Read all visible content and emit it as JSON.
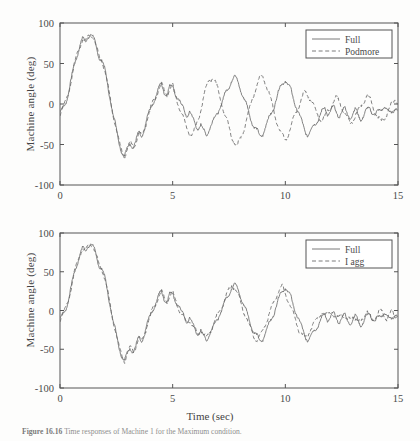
{
  "figure": {
    "caption_number": "Figure 16.16",
    "caption_text": "Time responses of Machine 1 for the Maximum condition."
  },
  "axis": {
    "xlabel": "Time (sec)",
    "ylabel": "Machine angle (deg)",
    "xticks": [
      "0",
      "5",
      "10",
      "15"
    ],
    "yticks": [
      "100",
      "50",
      "0",
      "-50",
      "-100"
    ]
  },
  "panels": [
    {
      "id": "top",
      "legend": [
        {
          "label": "Full",
          "style": "solid"
        },
        {
          "label": "Podmore",
          "style": "dashed"
        }
      ]
    },
    {
      "id": "bottom",
      "legend": [
        {
          "label": "Full",
          "style": "solid"
        },
        {
          "label": "I agg",
          "style": "dashed"
        }
      ]
    }
  ],
  "chart_data": [
    {
      "type": "line",
      "title": "",
      "xlabel": "",
      "ylabel": "Machine angle (deg)",
      "xlim": [
        0,
        15
      ],
      "ylim": [
        -100,
        100
      ],
      "xticks": [
        0,
        5,
        10,
        15
      ],
      "yticks": [
        -100,
        -50,
        0,
        50,
        100
      ],
      "grid": false,
      "legend_position": "top-right",
      "x": [
        0,
        0.12,
        0.25,
        0.37,
        0.5,
        0.62,
        0.75,
        0.87,
        1,
        1.12,
        1.25,
        1.37,
        1.5,
        1.62,
        1.75,
        1.87,
        2,
        2.12,
        2.25,
        2.37,
        2.5,
        2.62,
        2.75,
        2.87,
        3,
        3.12,
        3.25,
        3.37,
        3.5,
        3.62,
        3.75,
        3.87,
        4,
        4.12,
        4.25,
        4.37,
        4.5,
        4.62,
        4.75,
        4.87,
        5,
        5.12,
        5.25,
        5.37,
        5.5,
        5.62,
        5.75,
        5.87,
        6,
        6.12,
        6.25,
        6.37,
        6.5,
        6.62,
        6.75,
        6.87,
        7,
        7.12,
        7.25,
        7.37,
        7.5,
        7.62,
        7.75,
        7.87,
        8,
        8.12,
        8.25,
        8.37,
        8.5,
        8.62,
        8.75,
        8.87,
        9,
        9.12,
        9.25,
        9.37,
        9.5,
        9.62,
        9.75,
        9.87,
        10,
        10.12,
        10.25,
        10.37,
        10.5,
        10.62,
        10.75,
        10.87,
        11,
        11.12,
        11.25,
        11.37,
        11.5,
        11.62,
        11.75,
        11.87,
        12,
        12.12,
        12.25,
        12.37,
        12.5,
        12.62,
        12.75,
        12.87,
        13,
        13.12,
        13.25,
        13.37,
        13.5,
        13.62,
        13.75,
        13.87,
        14,
        14.12,
        14.25,
        14.37,
        14.5,
        14.62,
        14.75,
        14.87,
        15
      ],
      "series": [
        {
          "name": "Full",
          "style": "solid",
          "values": [
            -12,
            -6,
            2,
            14,
            30,
            46,
            60,
            72,
            80,
            76,
            84,
            87,
            80,
            68,
            58,
            54,
            40,
            22,
            4,
            -14,
            -32,
            -48,
            -58,
            -64,
            -56,
            -48,
            -52,
            -46,
            -36,
            -40,
            -30,
            -18,
            -8,
            2,
            10,
            18,
            24,
            16,
            12,
            20,
            22,
            14,
            6,
            -2,
            -6,
            -14,
            -10,
            -18,
            -24,
            -30,
            -26,
            -34,
            -38,
            -30,
            -24,
            -18,
            -10,
            -2,
            6,
            14,
            22,
            30,
            34,
            28,
            20,
            10,
            0,
            -10,
            -20,
            -28,
            -34,
            -40,
            -36,
            -28,
            -20,
            -12,
            -2,
            8,
            18,
            26,
            30,
            24,
            16,
            6,
            -4,
            -14,
            -24,
            -32,
            -38,
            -34,
            -28,
            -22,
            -16,
            -10,
            -6,
            -12,
            -8,
            -4,
            -10,
            -14,
            -10,
            -6,
            -12,
            -16,
            -12,
            -8,
            -14,
            -18,
            -14,
            -8,
            -4,
            -10,
            -14,
            -10,
            -6,
            -2,
            -8,
            -12,
            -8,
            -4,
            -10,
            -6,
            -2,
            -6
          ]
        },
        {
          "name": "Podmore",
          "style": "dashed",
          "values": [
            -12,
            -6,
            2,
            14,
            30,
            46,
            60,
            72,
            80,
            76,
            84,
            87,
            80,
            68,
            58,
            54,
            40,
            22,
            4,
            -14,
            -32,
            -48,
            -58,
            -64,
            -56,
            -48,
            -52,
            -46,
            -36,
            -40,
            -30,
            -18,
            -8,
            2,
            10,
            18,
            24,
            16,
            12,
            20,
            22,
            10,
            0,
            -10,
            -20,
            -30,
            -36,
            -38,
            -32,
            -20,
            -6,
            8,
            20,
            30,
            33,
            28,
            18,
            6,
            -6,
            -18,
            -30,
            -40,
            -48,
            -52,
            -44,
            -34,
            -22,
            -10,
            2,
            14,
            24,
            32,
            33,
            26,
            16,
            4,
            -10,
            -22,
            -32,
            -40,
            -44,
            -38,
            -28,
            -18,
            -8,
            0,
            8,
            14,
            12,
            6,
            -2,
            -10,
            -16,
            -20,
            -16,
            -10,
            -4,
            2,
            8,
            4,
            -2,
            -10,
            -18,
            -24,
            -20,
            -14,
            -8,
            -2,
            4,
            10,
            6,
            -2,
            -10,
            -18,
            -22,
            -18,
            -12,
            -6,
            0,
            6,
            2,
            -6,
            -14,
            -22,
            -24
          ]
        }
      ]
    },
    {
      "type": "line",
      "title": "",
      "xlabel": "Time (sec)",
      "ylabel": "Machine angle (deg)",
      "xlim": [
        0,
        15
      ],
      "ylim": [
        -100,
        100
      ],
      "xticks": [
        0,
        5,
        10,
        15
      ],
      "yticks": [
        -100,
        -50,
        0,
        50,
        100
      ],
      "grid": false,
      "legend_position": "top-right",
      "x": [
        0,
        0.12,
        0.25,
        0.37,
        0.5,
        0.62,
        0.75,
        0.87,
        1,
        1.12,
        1.25,
        1.37,
        1.5,
        1.62,
        1.75,
        1.87,
        2,
        2.12,
        2.25,
        2.37,
        2.5,
        2.62,
        2.75,
        2.87,
        3,
        3.12,
        3.25,
        3.37,
        3.5,
        3.62,
        3.75,
        3.87,
        4,
        4.12,
        4.25,
        4.37,
        4.5,
        4.62,
        4.75,
        4.87,
        5,
        5.12,
        5.25,
        5.37,
        5.5,
        5.62,
        5.75,
        5.87,
        6,
        6.12,
        6.25,
        6.37,
        6.5,
        6.62,
        6.75,
        6.87,
        7,
        7.12,
        7.25,
        7.37,
        7.5,
        7.62,
        7.75,
        7.87,
        8,
        8.12,
        8.25,
        8.37,
        8.5,
        8.62,
        8.75,
        8.87,
        9,
        9.12,
        9.25,
        9.37,
        9.5,
        9.62,
        9.75,
        9.87,
        10,
        10.12,
        10.25,
        10.37,
        10.5,
        10.62,
        10.75,
        10.87,
        11,
        11.12,
        11.25,
        11.37,
        11.5,
        11.62,
        11.75,
        11.87,
        12,
        12.12,
        12.25,
        12.37,
        12.5,
        12.62,
        12.75,
        12.87,
        13,
        13.12,
        13.25,
        13.37,
        13.5,
        13.62,
        13.75,
        13.87,
        14,
        14.12,
        14.25,
        14.37,
        14.5,
        14.62,
        14.75,
        14.87,
        15
      ],
      "series": [
        {
          "name": "Full",
          "style": "solid",
          "values": [
            -12,
            -6,
            2,
            14,
            30,
            46,
            60,
            72,
            80,
            76,
            84,
            87,
            80,
            68,
            58,
            54,
            40,
            22,
            4,
            -14,
            -32,
            -48,
            -58,
            -64,
            -56,
            -48,
            -52,
            -46,
            -36,
            -40,
            -30,
            -18,
            -8,
            2,
            10,
            18,
            24,
            16,
            12,
            20,
            22,
            14,
            6,
            -2,
            -6,
            -14,
            -10,
            -18,
            -24,
            -30,
            -26,
            -34,
            -38,
            -30,
            -24,
            -18,
            -10,
            -2,
            6,
            14,
            22,
            30,
            34,
            28,
            20,
            10,
            0,
            -10,
            -20,
            -28,
            -34,
            -40,
            -36,
            -28,
            -20,
            -12,
            -2,
            8,
            18,
            26,
            30,
            24,
            16,
            6,
            -4,
            -14,
            -24,
            -32,
            -38,
            -34,
            -28,
            -22,
            -16,
            -10,
            -6,
            -12,
            -8,
            -4,
            -10,
            -14,
            -10,
            -6,
            -12,
            -16,
            -12,
            -8,
            -14,
            -18,
            -14,
            -8,
            -4,
            -10,
            -14,
            -10,
            -6,
            -2,
            -8,
            -12,
            -8,
            -4,
            -10,
            -6,
            -2,
            -6
          ]
        },
        {
          "name": "I agg",
          "style": "dashed",
          "values": [
            -12,
            -6,
            2,
            14,
            30,
            46,
            60,
            72,
            80,
            76,
            84,
            87,
            80,
            68,
            58,
            54,
            40,
            22,
            4,
            -14,
            -32,
            -48,
            -58,
            -64,
            -56,
            -48,
            -52,
            -46,
            -36,
            -40,
            -30,
            -18,
            -8,
            2,
            10,
            18,
            24,
            16,
            12,
            20,
            22,
            14,
            4,
            -4,
            -10,
            -16,
            -12,
            -20,
            -26,
            -30,
            -24,
            -32,
            -36,
            -28,
            -22,
            -14,
            -6,
            2,
            10,
            18,
            26,
            33,
            30,
            22,
            12,
            2,
            -8,
            -18,
            -26,
            -34,
            -40,
            -34,
            -26,
            -16,
            -8,
            2,
            12,
            20,
            28,
            30,
            22,
            14,
            4,
            -6,
            -16,
            -26,
            -32,
            -36,
            -30,
            -24,
            -18,
            -12,
            -6,
            -2,
            -8,
            -4,
            0,
            -6,
            -12,
            -8,
            -2,
            -8,
            -14,
            -10,
            -6,
            -12,
            -16,
            -12,
            -6,
            -2,
            -8,
            -12,
            -8,
            -4,
            0,
            -6,
            -10,
            -6,
            -2,
            -8,
            -4,
            0,
            -4
          ]
        }
      ]
    }
  ]
}
